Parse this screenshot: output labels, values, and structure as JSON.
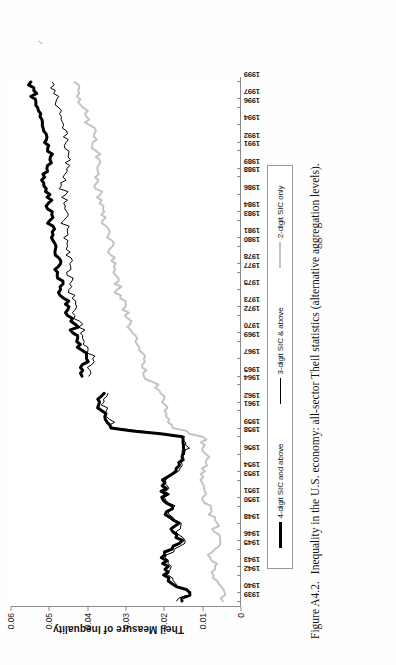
{
  "figure": {
    "number": "Figure A4.2.",
    "caption": "Inequality in the U.S. economy: all-sector Theil statistics (alternative aggregation levels)."
  },
  "axes": {
    "y_title": "Theil Measure of Inequality",
    "y_ticks": [
      "0",
      "0.01",
      "0.02",
      "0.03",
      "0.04",
      "0.05",
      "0.06"
    ],
    "y_min": 0,
    "y_max": 0.06
  },
  "legend": {
    "position": "below-plot",
    "items": [
      {
        "label": "4-digit SIC and above",
        "style": "thick",
        "color": "#000000"
      },
      {
        "label": "3-digit SIC & above",
        "style": "thin",
        "color": "#000000"
      },
      {
        "label": "2-digit SIC only",
        "style": "gray",
        "color": "#c4c4c4"
      }
    ]
  },
  "chart_data": {
    "type": "line",
    "title": "Inequality in the U.S. economy: all-sector Theil statistics (alternative aggregation levels).",
    "xlabel": "",
    "ylabel": "Theil Measure of Inequality",
    "ylim": [
      0,
      0.06
    ],
    "grid": false,
    "legend_position": "bottom",
    "x": [
      1939,
      1940,
      1941,
      1942,
      1943,
      1944,
      1945,
      1946,
      1947,
      1948,
      1949,
      1950,
      1951,
      1952,
      1953,
      1954,
      1955,
      1956,
      1957,
      1958,
      1959,
      1960,
      1961,
      1962,
      1963,
      1964,
      1965,
      1966,
      1967,
      1968,
      1969,
      1970,
      1971,
      1972,
      1973,
      1974,
      1975,
      1976,
      1977,
      1978,
      1979,
      1980,
      1981,
      1982,
      1983,
      1984,
      1985,
      1986,
      1987,
      1988,
      1989,
      1990,
      1991,
      1992,
      1993,
      1994,
      1995,
      1996,
      1997,
      1998,
      1999
    ],
    "tick_labels": [
      "1939",
      "1940",
      "1942",
      "1943",
      "1945",
      "1946",
      "1948",
      "1950",
      "1951",
      "1953",
      "1954",
      "1956",
      "1958",
      "1959",
      "1961",
      "1962",
      "1964",
      "1965",
      "1967",
      "1969",
      "1970",
      "1972",
      "1973",
      "1975",
      "1977",
      "1978",
      "1980",
      "1981",
      "1983",
      "1984",
      "1986",
      "1988",
      "1989",
      "1991",
      "1992",
      "1994",
      "1996",
      "1997",
      "1999"
    ],
    "series": [
      {
        "name": "4-digit SIC and above",
        "color": "#000000",
        "width": 3,
        "values": [
          0.0152,
          0.0132,
          0.0178,
          0.02,
          0.0188,
          0.0206,
          0.0178,
          0.015,
          0.0176,
          0.016,
          0.0196,
          0.0178,
          0.0205,
          0.0193,
          0.0203,
          0.0168,
          0.016,
          0.015,
          0.0148,
          0.0151,
          0.0338,
          0.0353,
          0.0362,
          0.0368,
          0.0356,
          null,
          0.0414,
          0.0418,
          0.0402,
          0.0414,
          0.0428,
          0.0438,
          0.0432,
          0.0452,
          0.0448,
          0.0462,
          0.047,
          0.0464,
          0.0478,
          0.047,
          0.0484,
          0.0482,
          0.0494,
          0.0486,
          0.0498,
          0.0492,
          0.0502,
          0.0498,
          0.0514,
          0.0512,
          0.0506,
          0.0498,
          0.0504,
          0.0512,
          0.0508,
          0.0518,
          0.0524,
          0.053,
          0.0536,
          0.054,
          0.0548
        ]
      },
      {
        "name": "3-digit SIC & above",
        "color": "#000000",
        "width": 1,
        "values": [
          0.0166,
          0.0128,
          0.0168,
          0.019,
          0.018,
          0.0196,
          0.0172,
          0.0144,
          0.0168,
          0.0154,
          0.0186,
          0.017,
          0.0198,
          0.0186,
          0.0194,
          0.0161,
          0.0153,
          0.0144,
          0.0142,
          0.0145,
          0.033,
          0.0342,
          0.035,
          0.0356,
          0.0346,
          null,
          0.0396,
          0.04,
          0.0386,
          0.0398,
          0.0408,
          0.0418,
          0.0412,
          0.0432,
          0.0428,
          0.044,
          0.0448,
          0.044,
          0.0454,
          0.0446,
          0.0456,
          0.0452,
          0.0462,
          0.0452,
          0.0462,
          0.0454,
          0.0462,
          0.0456,
          0.0468,
          0.0464,
          0.0454,
          0.0444,
          0.0448,
          0.0456,
          0.0452,
          0.0462,
          0.0468,
          0.0474,
          0.048,
          0.0484,
          0.0492
        ]
      },
      {
        "name": "2-digit SIC only",
        "color": "#c4c4c4",
        "width": 2,
        "values": [
          0.0045,
          0.004,
          0.0056,
          0.007,
          0.0066,
          0.0078,
          0.0066,
          0.0052,
          0.0068,
          0.006,
          0.0082,
          0.0076,
          0.0098,
          0.0094,
          0.0104,
          0.0092,
          0.009,
          0.009,
          0.0092,
          0.0098,
          0.0176,
          0.0186,
          0.0198,
          0.0204,
          0.0208,
          0.0214,
          0.0252,
          0.0256,
          0.0252,
          0.0264,
          0.0274,
          0.0282,
          0.0288,
          0.0302,
          0.03,
          0.0314,
          0.0322,
          0.0318,
          0.0332,
          0.0326,
          0.0338,
          0.0334,
          0.0348,
          0.0344,
          0.036,
          0.0356,
          0.0368,
          0.0366,
          0.0382,
          0.038,
          0.0374,
          0.0368,
          0.0376,
          0.0386,
          0.0382,
          0.0394,
          0.0402,
          0.041,
          0.0418,
          0.0424,
          0.0434
        ]
      }
    ]
  }
}
